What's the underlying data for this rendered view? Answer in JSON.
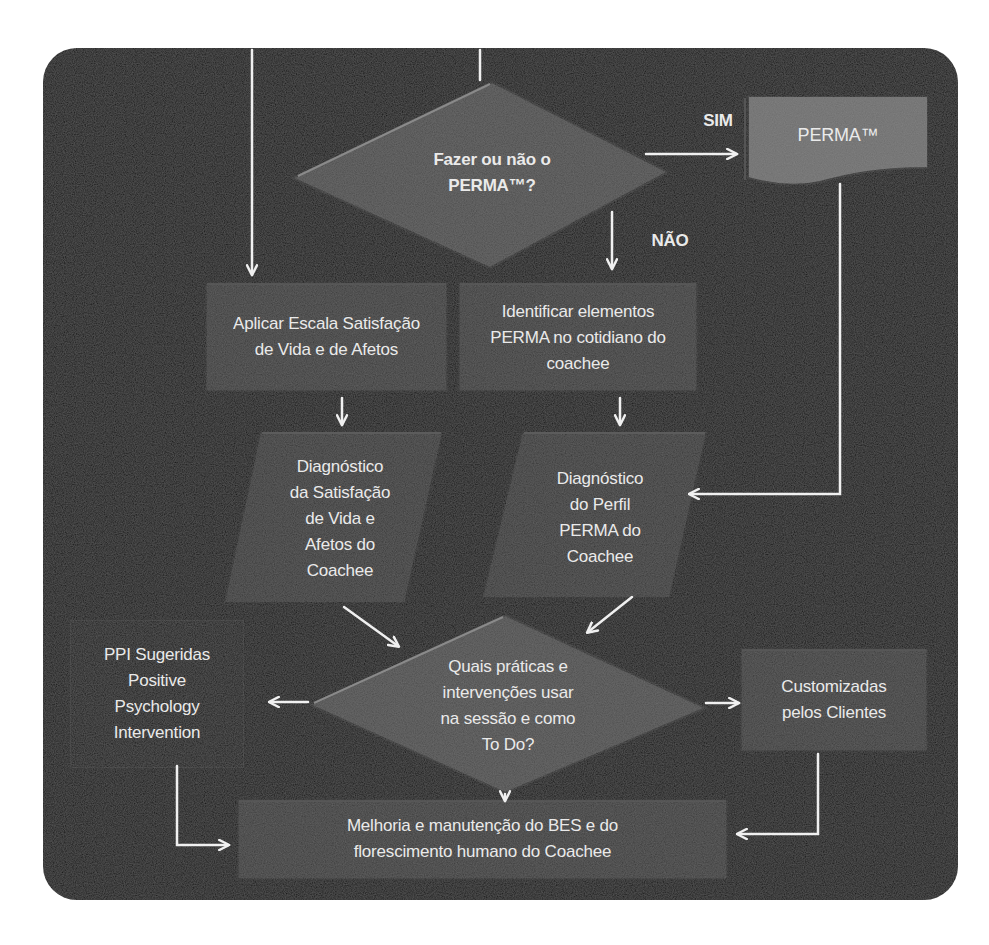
{
  "diagram": {
    "type": "flowchart",
    "colors": {
      "panel_bg": "#121212",
      "shape_fill": "#3a3a3a",
      "diamond_fill": "#4d4d4d",
      "perma_fill": "#6e6e6e",
      "text": "#eaeaea",
      "arrow": "#f0f0f0"
    },
    "nodes": {
      "decision_perma": {
        "lines": [
          "Fazer ou não o",
          "PERMA™?"
        ]
      },
      "perma_box": {
        "lines": [
          "PERMA™"
        ]
      },
      "apply_scale": {
        "lines": [
          "Aplicar Escala Satisfação",
          "de Vida e de Afetos"
        ]
      },
      "identify_elements": {
        "lines": [
          "Identificar elementos",
          "PERMA no cotidiano do",
          "coachee"
        ]
      },
      "diagnosis_satisfaction": {
        "lines": [
          "Diagnóstico",
          "da Satisfação",
          "de Vida e",
          "Afetos do",
          "Coachee"
        ]
      },
      "diagnosis_perma": {
        "lines": [
          "Diagnóstico",
          "do Perfil",
          "PERMA do",
          "Coachee"
        ]
      },
      "decision_practices": {
        "lines": [
          "Quais práticas e",
          "intervenções usar",
          "na sessão e como",
          "To Do?"
        ]
      },
      "ppi_suggested": {
        "lines": [
          "PPI Sugeridas",
          "Positive",
          "Psychology",
          "Intervention"
        ]
      },
      "customized": {
        "lines": [
          "Customizadas",
          "pelos Clientes"
        ]
      },
      "improvement": {
        "lines": [
          "Melhoria e manutenção do BES  e do",
          "florescimento humano do Coachee"
        ]
      }
    },
    "edge_labels": {
      "yes": "SIM",
      "no": "NÃO"
    },
    "edges": [
      {
        "from": "top-entry-left",
        "to": "apply_scale"
      },
      {
        "from": "top-entry-center",
        "to": "decision_perma"
      },
      {
        "from": "decision_perma",
        "to": "perma_box",
        "label": "SIM"
      },
      {
        "from": "decision_perma",
        "to": "identify_elements",
        "label": "NÃO"
      },
      {
        "from": "apply_scale",
        "to": "diagnosis_satisfaction"
      },
      {
        "from": "identify_elements",
        "to": "diagnosis_perma"
      },
      {
        "from": "perma_box",
        "to": "diagnosis_perma"
      },
      {
        "from": "diagnosis_satisfaction",
        "to": "decision_practices"
      },
      {
        "from": "diagnosis_perma",
        "to": "decision_practices"
      },
      {
        "from": "decision_practices",
        "to": "ppi_suggested"
      },
      {
        "from": "decision_practices",
        "to": "customized"
      },
      {
        "from": "decision_practices",
        "to": "improvement"
      },
      {
        "from": "ppi_suggested",
        "to": "improvement"
      },
      {
        "from": "customized",
        "to": "improvement"
      }
    ]
  }
}
